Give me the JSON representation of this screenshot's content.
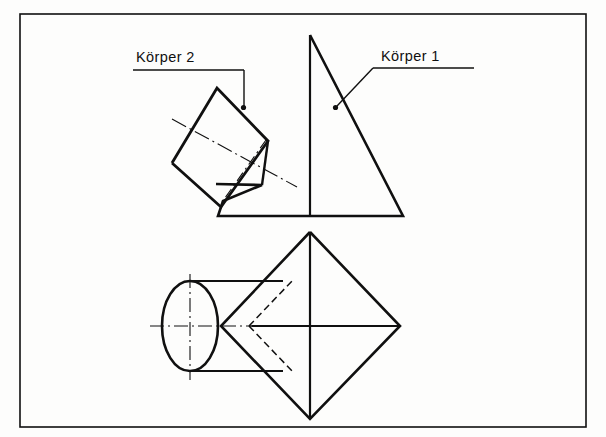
{
  "drawing": {
    "title": "Technische Zeichnung - Durchdringung Pyramide und Prisma",
    "background_color": "#fdfdfc",
    "line_color": "#101010",
    "frame": {
      "name": "drawing-frame",
      "x": 20,
      "y": 14,
      "width": 566,
      "height": 413,
      "stroke_width": 1.6
    },
    "labels": [
      {
        "id": "koerper-2",
        "text": "Körper 2",
        "text_x": 136,
        "text_y": 62,
        "underline": {
          "x1": 133,
          "y1": 70,
          "x2": 244,
          "y2": 70
        },
        "leader": {
          "x1": 244,
          "y1": 70,
          "x2": 244,
          "y2": 107
        },
        "dot": {
          "cx": 243,
          "cy": 108,
          "r": 2.4
        }
      },
      {
        "id": "koerper-1",
        "text": "Körper 1",
        "text_x": 381,
        "text_y": 61,
        "underline": {
          "x1": 373,
          "y1": 68,
          "x2": 474,
          "y2": 68
        },
        "leader_points": "373,68 336,107",
        "dot": {
          "cx": 335,
          "cy": 108,
          "r": 2.4
        }
      }
    ],
    "front_view": {
      "name": "front-view-elevation",
      "pyramid_outline": "310,35 403,216 218,216 223,201 262,185 216,184",
      "pyramid_axis": {
        "x1": 310,
        "y1": 35,
        "x2": 310,
        "y2": 216
      },
      "prism_box": "217,88 268,141 221,207 172,163",
      "prism_notch_edge": {
        "x1": 221,
        "y1": 207,
        "x2": 240,
        "y2": 180
      },
      "prism_axis_dashdot": {
        "x1": 175,
        "y1": 122,
        "x2": 295,
        "y2": 186
      },
      "prism_axis_dashdot_2": {
        "x1": 262,
        "y1": 185,
        "x2": 222,
        "y2": 204
      },
      "intersection_curve": "262,185 268,141"
    },
    "top_view": {
      "name": "top-view-plan",
      "diamond_outline": "310,232 400,326 310,419 221,326",
      "diamond_axis_vertical": {
        "x1": 310,
        "y1": 232,
        "x2": 310,
        "y2": 419
      },
      "diamond_axis_horizontal": {
        "x1": 252,
        "y1": 326,
        "x2": 400,
        "y2": 326
      },
      "ellipse": {
        "cx": 190,
        "cy": 326,
        "rx": 28,
        "ry": 45
      },
      "ellipse_center_h": {
        "x1": 152,
        "y1": 326,
        "x2": 262,
        "y2": 326
      },
      "ellipse_center_v": {
        "x1": 190,
        "y1": 276,
        "x2": 190,
        "y2": 378
      },
      "upper_contour": {
        "x1": 190,
        "y1": 281,
        "x2": 282,
        "y2": 281
      },
      "lower_contour": {
        "x1": 190,
        "y1": 371,
        "x2": 282,
        "y2": 371
      },
      "hidden_upper": {
        "x1": 250,
        "y1": 326,
        "x2": 292,
        "y2": 281
      },
      "hidden_lower": {
        "x1": 250,
        "y1": 326,
        "x2": 292,
        "y2": 371
      },
      "apex_dashdot": {
        "x1": 250,
        "y1": 326,
        "x2": 310,
        "y2": 326
      }
    }
  }
}
